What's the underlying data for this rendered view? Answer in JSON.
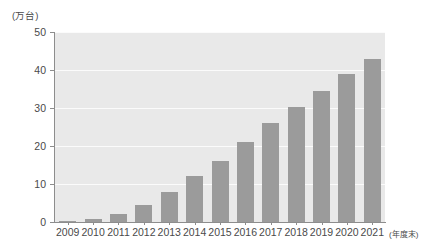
{
  "chart_data": {
    "type": "bar",
    "title": "",
    "subtitle": "",
    "xlabel": "(年度末)",
    "ylabel": "(万台)",
    "categories": [
      "2009",
      "2010",
      "2011",
      "2012",
      "2013",
      "2014",
      "2015",
      "2016",
      "2017",
      "2018",
      "2019",
      "2020",
      "2021"
    ],
    "values": [
      0.1,
      0.8,
      2.2,
      4.5,
      8.0,
      12.0,
      16.0,
      21.0,
      26.0,
      30.3,
      34.5,
      39.0,
      43.0
    ],
    "ylim": [
      0,
      50
    ],
    "yticks": [
      0,
      10,
      20,
      30,
      40,
      50
    ],
    "ytick_labels": [
      "0",
      "10",
      "20",
      "30",
      "40",
      "50"
    ],
    "grid": true,
    "legend": false,
    "series": [
      {
        "name": "",
        "values": [
          0.1,
          0.8,
          2.2,
          4.5,
          8.0,
          12.0,
          16.0,
          21.0,
          26.0,
          30.3,
          34.5,
          39.0,
          43.0
        ]
      }
    ],
    "colors": {
      "bar": "#9b9b9b",
      "plot_background": "#e9e9e9",
      "gridline": "#fbfbfb",
      "axis": "#8d8d8d",
      "text": "#4a4a4a"
    }
  }
}
